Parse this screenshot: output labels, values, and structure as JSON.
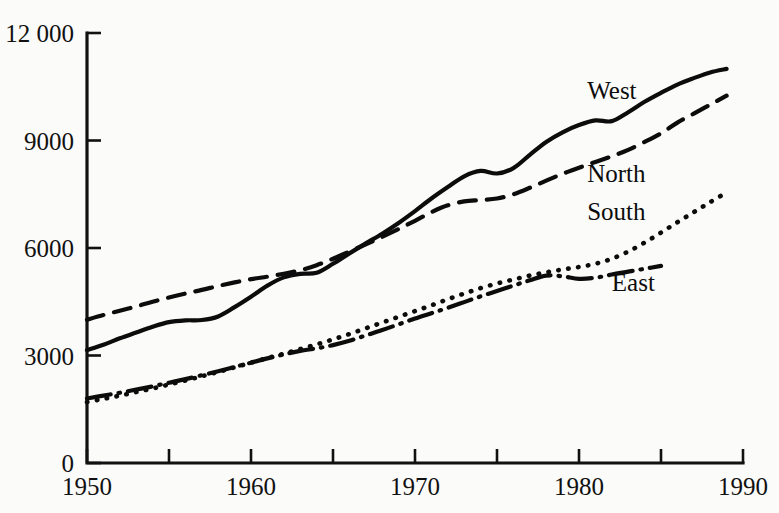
{
  "chart_data": {
    "type": "line",
    "title": "",
    "xlabel": "",
    "ylabel": "",
    "xlim": [
      1950,
      1990
    ],
    "ylim": [
      0,
      12000
    ],
    "grid": false,
    "legend_position": "direct-labels",
    "x_ticks": [
      1950,
      1960,
      1970,
      1980,
      1990
    ],
    "x_tick_labels": [
      "1950",
      "1960",
      "1970",
      "1980",
      "1990"
    ],
    "x_minor_ticks": [
      1955,
      1965,
      1975,
      1985
    ],
    "y_ticks": [
      0,
      3000,
      6000,
      9000,
      12000
    ],
    "y_tick_labels": [
      "0",
      "3000",
      "6000",
      "9000",
      "12 000"
    ],
    "series": [
      {
        "name": "West",
        "label": "West",
        "line_style": "solid",
        "x": [
          1950,
          1951,
          1952,
          1953,
          1954,
          1955,
          1956,
          1957,
          1958,
          1959,
          1960,
          1961,
          1962,
          1963,
          1964,
          1965,
          1966,
          1967,
          1968,
          1969,
          1970,
          1971,
          1972,
          1973,
          1974,
          1975,
          1976,
          1977,
          1978,
          1979,
          1980,
          1981,
          1982,
          1983,
          1984,
          1985,
          1986,
          1987,
          1988,
          1989
        ],
        "values": [
          3150,
          3300,
          3480,
          3640,
          3800,
          3930,
          3980,
          3990,
          4090,
          4350,
          4640,
          4950,
          5180,
          5280,
          5310,
          5560,
          5850,
          6130,
          6400,
          6700,
          7030,
          7380,
          7700,
          8000,
          8150,
          8080,
          8230,
          8600,
          8960,
          9230,
          9430,
          9560,
          9540,
          9790,
          10080,
          10330,
          10560,
          10740,
          10900,
          11000
        ]
      },
      {
        "name": "North",
        "label": "North",
        "line_style": "dashed",
        "x": [
          1950,
          1951,
          1952,
          1953,
          1954,
          1955,
          1956,
          1957,
          1958,
          1959,
          1960,
          1961,
          1962,
          1963,
          1964,
          1965,
          1966,
          1967,
          1968,
          1969,
          1970,
          1971,
          1972,
          1973,
          1974,
          1975,
          1976,
          1977,
          1978,
          1979,
          1980,
          1981,
          1982,
          1983,
          1984,
          1985,
          1986,
          1987,
          1988,
          1989
        ],
        "values": [
          4000,
          4130,
          4250,
          4370,
          4500,
          4620,
          4730,
          4830,
          4940,
          5040,
          5130,
          5200,
          5280,
          5380,
          5520,
          5700,
          5900,
          6100,
          6310,
          6530,
          6760,
          7000,
          7190,
          7300,
          7340,
          7380,
          7500,
          7680,
          7880,
          8070,
          8240,
          8400,
          8560,
          8740,
          8960,
          9200,
          9500,
          9750,
          10000,
          10250
        ]
      },
      {
        "name": "South",
        "label": "South",
        "line_style": "dotted",
        "x": [
          1950,
          1951,
          1952,
          1953,
          1954,
          1955,
          1956,
          1957,
          1958,
          1959,
          1960,
          1961,
          1962,
          1963,
          1964,
          1965,
          1966,
          1967,
          1968,
          1969,
          1970,
          1971,
          1972,
          1973,
          1974,
          1975,
          1976,
          1977,
          1978,
          1979,
          1980,
          1981,
          1982,
          1983,
          1984,
          1985,
          1986,
          1987,
          1988,
          1989
        ],
        "values": [
          1700,
          1790,
          1880,
          1980,
          2080,
          2190,
          2300,
          2420,
          2540,
          2670,
          2800,
          2930,
          3050,
          3180,
          3310,
          3450,
          3600,
          3760,
          3920,
          4080,
          4240,
          4400,
          4570,
          4730,
          4880,
          5010,
          5120,
          5230,
          5320,
          5400,
          5470,
          5560,
          5700,
          5900,
          6150,
          6430,
          6720,
          7000,
          7280,
          7550
        ]
      },
      {
        "name": "East",
        "label": "East",
        "line_style": "dash-dot",
        "x": [
          1950,
          1951,
          1952,
          1953,
          1954,
          1955,
          1956,
          1957,
          1958,
          1959,
          1960,
          1961,
          1962,
          1963,
          1964,
          1965,
          1966,
          1967,
          1968,
          1969,
          1970,
          1971,
          1972,
          1973,
          1974,
          1975,
          1976,
          1977,
          1978,
          1979,
          1980,
          1981,
          1982,
          1983,
          1984,
          1985
        ],
        "values": [
          1800,
          1880,
          1960,
          2050,
          2140,
          2240,
          2340,
          2450,
          2560,
          2680,
          2800,
          2920,
          3030,
          3130,
          3200,
          3290,
          3410,
          3560,
          3710,
          3870,
          4030,
          4180,
          4330,
          4490,
          4650,
          4800,
          4950,
          5100,
          5230,
          5210,
          5140,
          5170,
          5260,
          5340,
          5420,
          5500
        ]
      }
    ],
    "labels": [
      {
        "text": "West",
        "x": 1980.5,
        "y": 10150
      },
      {
        "text": "North",
        "x": 1980.5,
        "y": 7830
      },
      {
        "text": "South",
        "x": 1980.5,
        "y": 6770
      },
      {
        "text": "East",
        "x": 1982.0,
        "y": 4790
      }
    ],
    "colors": {
      "ink": "#0c0c0c",
      "axis": "#111111",
      "background": "#fbfbf9"
    }
  }
}
